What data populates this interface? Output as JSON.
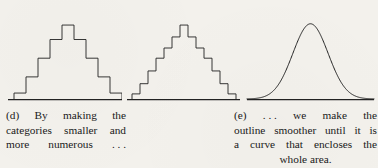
{
  "figure": {
    "background_color": "#f3f1ec",
    "ink_color": "#222222",
    "panels": [
      {
        "id": "hist-coarse",
        "part_label": "(d)",
        "type": "histogram-step-outline",
        "baseline_y": 101,
        "description": "symmetric stepped histogram outline with 9 bars"
      },
      {
        "id": "hist-fine",
        "part_label": "(d)",
        "type": "histogram-step-outline",
        "baseline_y": 101,
        "description": "symmetric stepped histogram outline with 13 narrower bars"
      },
      {
        "id": "curve",
        "part_label": "(e)",
        "type": "smooth-bell-curve",
        "baseline_y": 101,
        "description": "smooth normal distribution curve enclosing the whole area"
      }
    ]
  },
  "chart_data": [
    {
      "type": "bar",
      "id": "hist-coarse",
      "title": "",
      "xlabel": "",
      "ylabel": "",
      "grid": false,
      "legend": null,
      "categories": [
        "1",
        "2",
        "3",
        "4",
        "5",
        "6",
        "7",
        "8",
        "9"
      ],
      "values": [
        7,
        26,
        48,
        70,
        87,
        70,
        48,
        26,
        7
      ],
      "ylim": [
        0,
        100
      ],
      "bar_width_px": 12
    },
    {
      "type": "bar",
      "id": "hist-fine",
      "title": "",
      "xlabel": "",
      "ylabel": "",
      "grid": false,
      "legend": null,
      "categories": [
        "1",
        "2",
        "3",
        "4",
        "5",
        "6",
        "7",
        "8",
        "9",
        "10",
        "11",
        "12",
        "13"
      ],
      "values": [
        6,
        18,
        33,
        48,
        60,
        73,
        87,
        73,
        60,
        48,
        33,
        18,
        6
      ],
      "ylim": [
        0,
        100
      ],
      "bar_width_px": 8
    },
    {
      "type": "line",
      "id": "curve",
      "title": "",
      "xlabel": "",
      "ylabel": "",
      "grid": false,
      "legend": null,
      "x": [
        0,
        10,
        20,
        30,
        40,
        50,
        60,
        70,
        80,
        90,
        100
      ],
      "y": [
        1,
        3,
        8,
        23,
        58,
        88,
        58,
        23,
        8,
        3,
        1
      ],
      "ylim": [
        0,
        100
      ],
      "curve_shape": "gaussian"
    }
  ],
  "captions": {
    "d": {
      "lines": [
        [
          "(d)",
          "By",
          "making",
          "the"
        ],
        [
          "categories",
          "smaller",
          "and"
        ],
        [
          "more",
          "numerous",
          ". . ."
        ]
      ]
    },
    "e": {
      "lines": [
        [
          "(e)",
          ". . .",
          "we",
          "make",
          "the"
        ],
        [
          "outline",
          "smoother",
          "until",
          "it",
          "is"
        ],
        [
          "a",
          "curve",
          "that",
          "encloses",
          "the"
        ],
        [
          "whole",
          "area."
        ]
      ]
    }
  }
}
